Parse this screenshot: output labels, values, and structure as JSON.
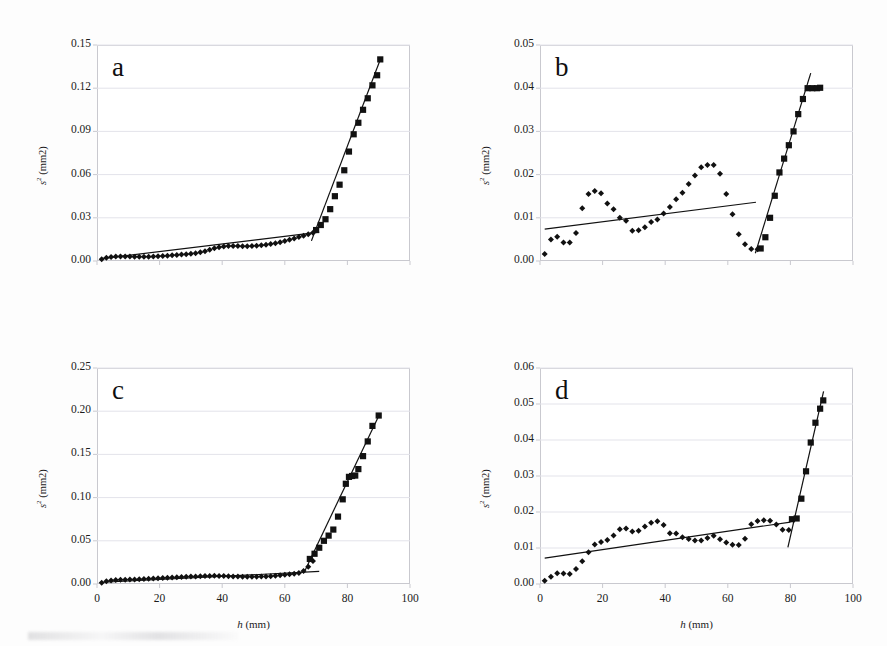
{
  "figure": {
    "background": "#fdfdfd",
    "axis_color": "#c9c9cf",
    "grid_color": "#e3e3ea",
    "marker_color": "#111111",
    "fit_line_color": "#111111"
  },
  "common": {
    "ylabel_s": "s",
    "ylabel_sup": "2",
    "ylabel_unit": " (mm2)",
    "xlabel_h": "h",
    "xlabel_unit": " (mm)"
  },
  "chart_data": [
    {
      "type": "scatter",
      "panel": "a",
      "title": "a",
      "xlabel": "h (mm)",
      "ylabel": "s2 (mm2)",
      "xlim": [
        0,
        100
      ],
      "ylim": [
        0,
        0.15
      ],
      "xticks": [
        0,
        20,
        40,
        60,
        80,
        100
      ],
      "xticklabels": [
        "",
        "",
        "",
        "",
        "",
        ""
      ],
      "yticks": [
        0.0,
        0.03,
        0.06,
        0.09,
        0.12,
        0.15
      ],
      "yticklabels": [
        "0.00",
        "0.03",
        "0.06",
        "0.09",
        "0.12",
        "0.15"
      ],
      "grid": true,
      "legend": "none",
      "series": [
        {
          "name": "pre-breakpoint diamonds",
          "marker": "diamond",
          "x": [
            1.5,
            3,
            4.5,
            6,
            7.5,
            9,
            10.5,
            12,
            13.5,
            15,
            16.5,
            18,
            19.5,
            21,
            22.5,
            24,
            25.5,
            27,
            28.5,
            30,
            31.5,
            33,
            34.5,
            36,
            37.5,
            39,
            40.5,
            42,
            43.5,
            45,
            46.5,
            48,
            49.5,
            51,
            52.5,
            54,
            55.5,
            57,
            58.5,
            60,
            61.5,
            63,
            64.5,
            66,
            67.5,
            69
          ],
          "y": [
            0.0012,
            0.0022,
            0.0028,
            0.0031,
            0.0032,
            0.0032,
            0.0031,
            0.003,
            0.0029,
            0.0029,
            0.003,
            0.0031,
            0.0033,
            0.0035,
            0.0037,
            0.004,
            0.0042,
            0.0045,
            0.0047,
            0.005,
            0.0054,
            0.006,
            0.0068,
            0.0078,
            0.0088,
            0.0096,
            0.0101,
            0.0104,
            0.0105,
            0.0104,
            0.0103,
            0.0103,
            0.0104,
            0.0106,
            0.0109,
            0.0113,
            0.0118,
            0.0124,
            0.0131,
            0.0139,
            0.0148,
            0.0157,
            0.0166,
            0.0175,
            0.0185,
            0.0196
          ]
        },
        {
          "name": "post-breakpoint squares",
          "marker": "square",
          "x": [
            70,
            71.5,
            73,
            74.5,
            76,
            77.5,
            79,
            80.5,
            82,
            83.5,
            85,
            86.5,
            88,
            89.5,
            90.5
          ],
          "y": [
            0.0215,
            0.025,
            0.029,
            0.036,
            0.045,
            0.053,
            0.063,
            0.076,
            0.088,
            0.096,
            0.105,
            0.113,
            0.122,
            0.129,
            0.14
          ]
        }
      ],
      "fits": [
        {
          "name": "shallow-fit",
          "x0": 2,
          "y0": 0.0018,
          "x1": 71,
          "y1": 0.02
        },
        {
          "name": "steep-fit",
          "x0": 68.5,
          "y0": 0.014,
          "x1": 90.6,
          "y1": 0.1405
        }
      ]
    },
    {
      "type": "scatter",
      "panel": "b",
      "title": "b",
      "xlabel": "h (mm)",
      "ylabel": "s2 (mm2)",
      "xlim": [
        0,
        100
      ],
      "ylim": [
        0,
        0.05
      ],
      "xticks": [
        0,
        20,
        40,
        60,
        80,
        100
      ],
      "xticklabels": [
        "",
        "",
        "",
        "",
        "",
        ""
      ],
      "yticks": [
        0.0,
        0.01,
        0.02,
        0.03,
        0.04,
        0.05
      ],
      "yticklabels": [
        "0.00",
        "0.01",
        "0.02",
        "0.03",
        "0.04",
        "0.05"
      ],
      "grid": true,
      "legend": "none",
      "series": [
        {
          "name": "pre-breakpoint diamonds",
          "marker": "diamond",
          "x": [
            1.5,
            3.5,
            5.5,
            7.5,
            9.5,
            11.5,
            13.5,
            15.5,
            17.5,
            19.5,
            21.5,
            23.5,
            25.5,
            27.5,
            29.5,
            31.5,
            33.5,
            35.5,
            37.5,
            39.5,
            41.5,
            43.5,
            45.5,
            47.5,
            49.5,
            51.5,
            53.5,
            55.5,
            57.5,
            59.5,
            61.5,
            63.5,
            65.5,
            67.5,
            69.5
          ],
          "y": [
            0.0016,
            0.005,
            0.0056,
            0.0043,
            0.0043,
            0.0065,
            0.0122,
            0.0155,
            0.0162,
            0.0157,
            0.0133,
            0.012,
            0.01,
            0.0093,
            0.007,
            0.0071,
            0.0078,
            0.009,
            0.0096,
            0.011,
            0.0125,
            0.0143,
            0.0158,
            0.0178,
            0.0198,
            0.0217,
            0.0222,
            0.0222,
            0.0202,
            0.0155,
            0.0108,
            0.0062,
            0.0039,
            0.0028,
            0.0027
          ]
        },
        {
          "name": "post-breakpoint squares",
          "marker": "square",
          "x": [
            70.5,
            72,
            73.5,
            75,
            76.5,
            78,
            79.5,
            81,
            82.5,
            84,
            85.5,
            87,
            88.5,
            89.5
          ],
          "y": [
            0.0029,
            0.0055,
            0.01,
            0.0151,
            0.0205,
            0.0237,
            0.0268,
            0.03,
            0.034,
            0.0375,
            0.04,
            0.04,
            0.04,
            0.0401
          ]
        }
      ],
      "fits": [
        {
          "name": "shallow-fit",
          "x0": 1.5,
          "y0": 0.0074,
          "x1": 69,
          "y1": 0.0136
        },
        {
          "name": "steep-fit",
          "x0": 68.8,
          "y0": 0.0018,
          "x1": 86.5,
          "y1": 0.0435
        }
      ]
    },
    {
      "type": "scatter",
      "panel": "c",
      "title": "c",
      "xlabel": "h (mm)",
      "ylabel": "s2 (mm2)",
      "xlim": [
        0,
        100
      ],
      "ylim": [
        0,
        0.25
      ],
      "xticks": [
        0,
        20,
        40,
        60,
        80,
        100
      ],
      "xticklabels": [
        "0",
        "20",
        "40",
        "60",
        "80",
        "100"
      ],
      "yticks": [
        0.0,
        0.05,
        0.1,
        0.15,
        0.2,
        0.25
      ],
      "yticklabels": [
        "0.00",
        "0.05",
        "0.10",
        "0.15",
        "0.20",
        "0.25"
      ],
      "grid": true,
      "legend": "none",
      "series": [
        {
          "name": "pre-breakpoint diamonds",
          "marker": "diamond",
          "x": [
            1.5,
            3,
            4.5,
            6,
            7.5,
            9,
            10.5,
            12,
            13.5,
            15,
            16.5,
            18,
            19.5,
            21,
            22.5,
            24,
            25.5,
            27,
            28.5,
            30,
            31.5,
            33,
            34.5,
            36,
            37.5,
            39,
            40.5,
            42,
            43.5,
            45,
            46.5,
            48,
            49.5,
            51,
            52.5,
            54,
            55.5,
            57,
            58.5,
            60,
            61.5,
            63,
            64.5,
            66,
            67.5,
            69
          ],
          "y": [
            0.0015,
            0.0032,
            0.004,
            0.0045,
            0.0048,
            0.005,
            0.0052,
            0.0053,
            0.0055,
            0.0057,
            0.006,
            0.0063,
            0.0066,
            0.0069,
            0.0072,
            0.0075,
            0.0078,
            0.0081,
            0.0084,
            0.0086,
            0.0088,
            0.009,
            0.0092,
            0.0094,
            0.0095,
            0.0094,
            0.0092,
            0.009,
            0.0088,
            0.0086,
            0.0085,
            0.0084,
            0.0084,
            0.0085,
            0.0086,
            0.0088,
            0.0091,
            0.0095,
            0.01,
            0.0106,
            0.0113,
            0.012,
            0.0128,
            0.015,
            0.02,
            0.0265
          ]
        },
        {
          "name": "post-breakpoint squares",
          "marker": "square",
          "x": [
            68,
            69.5,
            71,
            72.5,
            74,
            75.5,
            77,
            78.5,
            79.5,
            80.5,
            81.5,
            82.5,
            83.5,
            85,
            86.5,
            88,
            90
          ],
          "y": [
            0.029,
            0.035,
            0.042,
            0.05,
            0.056,
            0.063,
            0.078,
            0.098,
            0.116,
            0.124,
            0.125,
            0.1255,
            0.133,
            0.148,
            0.165,
            0.183,
            0.195
          ]
        }
      ],
      "fits": [
        {
          "name": "shallow-fit",
          "x0": 2,
          "y0": 0.002,
          "x1": 71,
          "y1": 0.0145
        },
        {
          "name": "steep-fit",
          "x0": 66.5,
          "y0": 0.016,
          "x1": 90.2,
          "y1": 0.196
        }
      ]
    },
    {
      "type": "scatter",
      "panel": "d",
      "title": "d",
      "xlabel": "h (mm)",
      "ylabel": "s2 (mm2)",
      "xlim": [
        0,
        100
      ],
      "ylim": [
        0,
        0.06
      ],
      "xticks": [
        0,
        20,
        40,
        60,
        80,
        100
      ],
      "xticklabels": [
        "0",
        "20",
        "40",
        "60",
        "80",
        "100"
      ],
      "yticks": [
        0.0,
        0.01,
        0.02,
        0.03,
        0.04,
        0.05,
        0.06
      ],
      "yticklabels": [
        "0.00",
        "0.01",
        "0.02",
        "0.03",
        "0.04",
        "0.05",
        "0.06"
      ],
      "grid": true,
      "legend": "none",
      "series": [
        {
          "name": "pre-breakpoint diamonds",
          "marker": "diamond",
          "x": [
            1.5,
            3.5,
            5.5,
            7.5,
            9.5,
            11.5,
            13.5,
            15.5,
            17.5,
            19.5,
            21.5,
            23.5,
            25.5,
            27.5,
            29.5,
            31.5,
            33.5,
            35.5,
            37.5,
            39.5,
            41.5,
            43.5,
            45.5,
            47.5,
            49.5,
            51.5,
            53.5,
            55.5,
            57.5,
            59.5,
            61.5,
            63.5,
            65.5,
            67.5,
            69.5,
            71.5,
            73.5,
            75.5,
            77.5,
            79.5
          ],
          "y": [
            0.0009,
            0.002,
            0.003,
            0.0029,
            0.0028,
            0.0042,
            0.0063,
            0.0088,
            0.011,
            0.0117,
            0.0122,
            0.0135,
            0.0152,
            0.0154,
            0.0146,
            0.0148,
            0.016,
            0.017,
            0.0174,
            0.0164,
            0.0141,
            0.014,
            0.013,
            0.0125,
            0.0121,
            0.0121,
            0.0128,
            0.0134,
            0.0124,
            0.0115,
            0.0109,
            0.0108,
            0.0126,
            0.0166,
            0.0175,
            0.0177,
            0.0176,
            0.0165,
            0.0151,
            0.015
          ]
        },
        {
          "name": "post-breakpoint squares",
          "marker": "square",
          "x": [
            80.5,
            82,
            83.5,
            85,
            86.5,
            88,
            89.5,
            90.5
          ],
          "y": [
            0.018,
            0.0182,
            0.0237,
            0.0313,
            0.0393,
            0.0448,
            0.0487,
            0.051
          ]
        }
      ],
      "fits": [
        {
          "name": "shallow-fit",
          "x0": 1.5,
          "y0": 0.0072,
          "x1": 80,
          "y1": 0.0172
        },
        {
          "name": "steep-fit",
          "x0": 79.2,
          "y0": 0.0102,
          "x1": 90.6,
          "y1": 0.0535
        }
      ]
    }
  ]
}
